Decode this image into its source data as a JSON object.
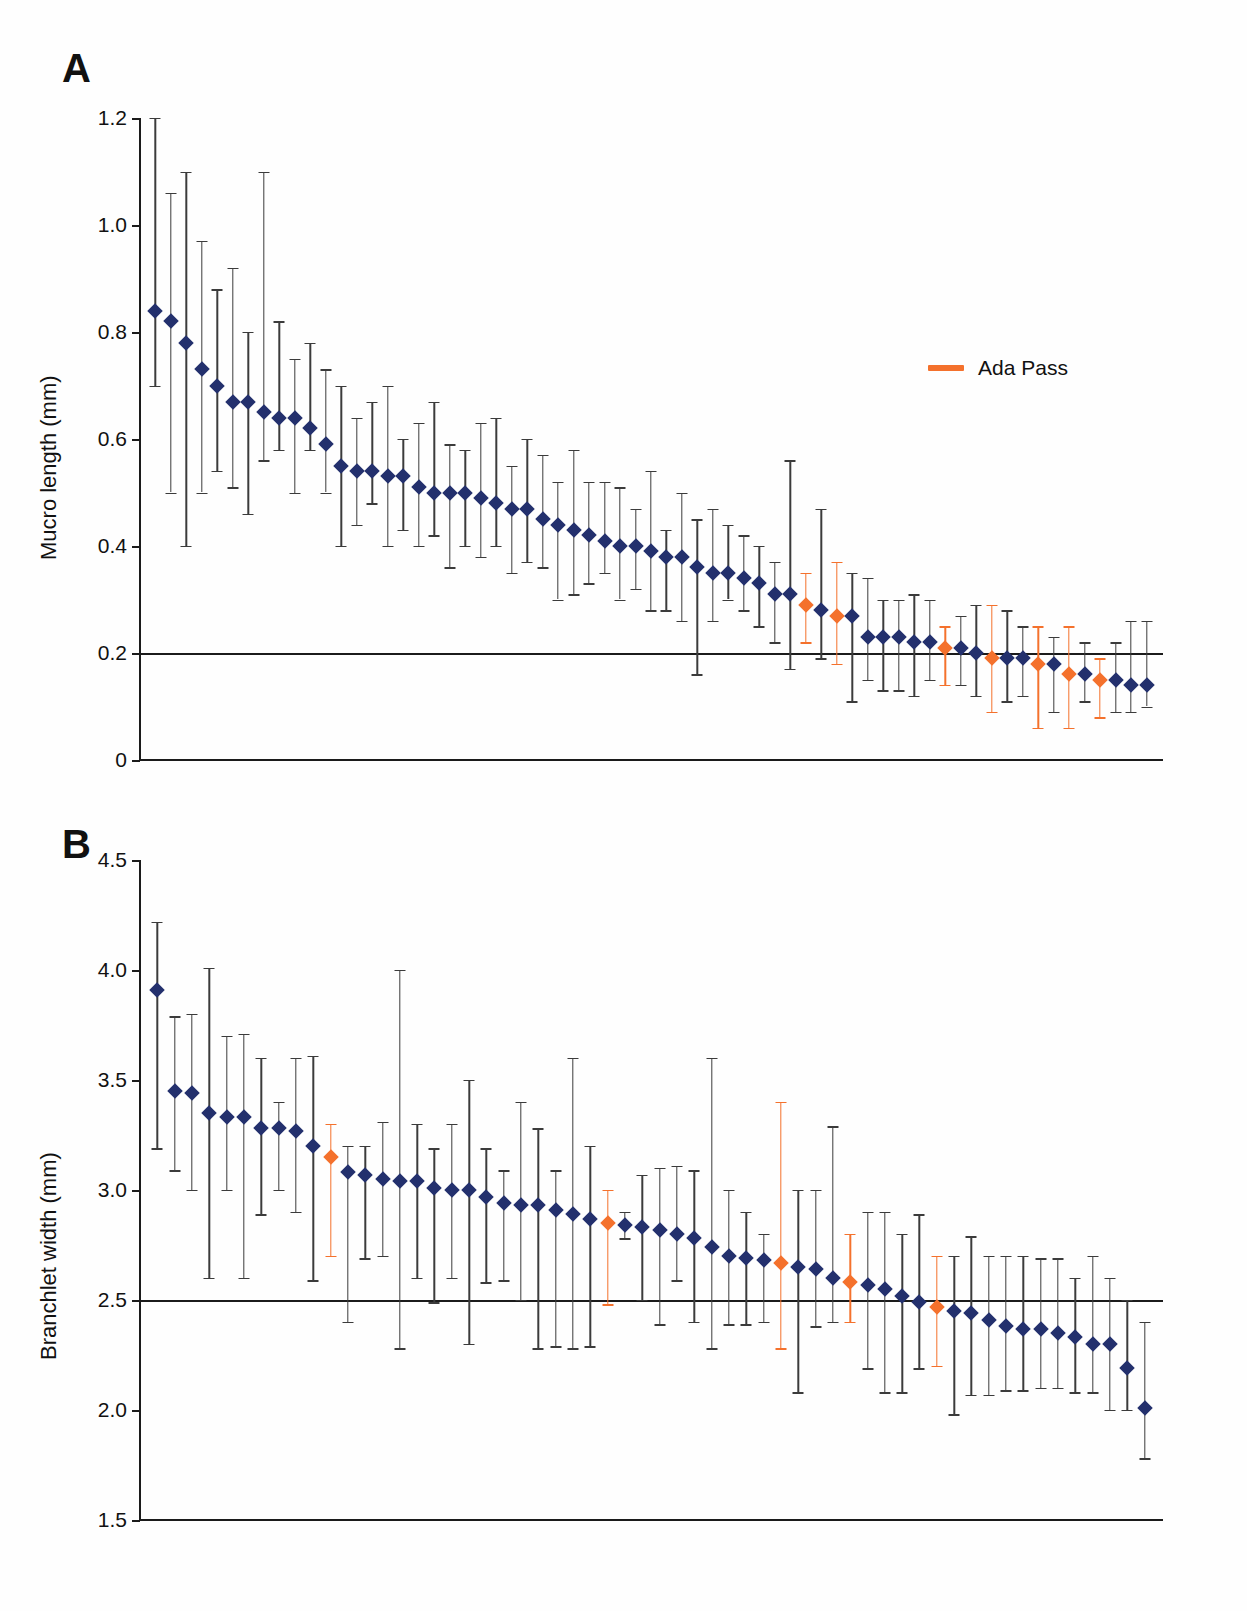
{
  "figure": {
    "background": "#ffffff",
    "marker_color": "#23306d",
    "highlight_color": "#f4712c",
    "axis_color": "#1b1b1b"
  },
  "panels": [
    {
      "letter": "A",
      "ylabel": "Mucro length (mm)",
      "yticks": [
        "0",
        "0.2",
        "0.4",
        "0.6",
        "0.8",
        "1.0",
        "1.2"
      ],
      "reference_line": "0.2",
      "legend": {
        "label": "Ada Pass",
        "swatch": "orange-line-swatch"
      }
    },
    {
      "letter": "B",
      "ylabel": "Branchlet width (mm)",
      "yticks": [
        "1.5",
        "2.0",
        "2.5",
        "3.0",
        "3.5",
        "4.0",
        "4.5"
      ],
      "reference_line": "2.5"
    }
  ],
  "chart_data": [
    {
      "type": "scatter",
      "panel": "A",
      "title": "",
      "xlabel": "",
      "ylabel": "Mucro length (mm)",
      "ylim": [
        0,
        1.2
      ],
      "yticks": [
        0,
        0.2,
        0.4,
        0.6,
        0.8,
        1.0,
        1.2
      ],
      "grid": false,
      "reference_line_y": 0.2,
      "legend": [
        "Ada Pass"
      ],
      "legend_position": "upper-right",
      "error_bars": "min-max range per population",
      "note": "Populations ranked by decreasing mean mucro length",
      "series": [
        {
          "name": "Mucro length mean (min, max)",
          "mean": [
            0.84,
            0.82,
            0.78,
            0.73,
            0.7,
            0.67,
            0.67,
            0.65,
            0.64,
            0.64,
            0.62,
            0.59,
            0.55,
            0.54,
            0.54,
            0.53,
            0.53,
            0.51,
            0.5,
            0.5,
            0.5,
            0.49,
            0.48,
            0.47,
            0.47,
            0.45,
            0.44,
            0.43,
            0.42,
            0.41,
            0.4,
            0.4,
            0.39,
            0.38,
            0.38,
            0.36,
            0.35,
            0.35,
            0.34,
            0.33,
            0.31,
            0.31,
            0.29,
            0.28,
            0.27,
            0.27,
            0.23,
            0.23,
            0.23,
            0.22,
            0.22,
            0.21,
            0.21,
            0.2,
            0.19,
            0.19,
            0.19,
            0.18,
            0.18,
            0.16,
            0.16,
            0.15,
            0.15,
            0.14,
            0.14
          ],
          "min": [
            0.7,
            0.5,
            0.4,
            0.5,
            0.54,
            0.51,
            0.46,
            0.56,
            0.58,
            0.5,
            0.58,
            0.5,
            0.4,
            0.44,
            0.48,
            0.4,
            0.43,
            0.4,
            0.42,
            0.36,
            0.4,
            0.38,
            0.4,
            0.35,
            0.37,
            0.36,
            0.3,
            0.31,
            0.33,
            0.35,
            0.3,
            0.32,
            0.28,
            0.28,
            0.26,
            0.16,
            0.26,
            0.3,
            0.28,
            0.25,
            0.22,
            0.17,
            0.22,
            0.19,
            0.18,
            0.11,
            0.15,
            0.13,
            0.13,
            0.12,
            0.15,
            0.14,
            0.14,
            0.12,
            0.09,
            0.11,
            0.12,
            0.06,
            0.09,
            0.06,
            0.11,
            0.08,
            0.09,
            0.09,
            0.1
          ],
          "max": [
            1.2,
            1.06,
            1.1,
            0.97,
            0.88,
            0.92,
            0.8,
            1.1,
            0.82,
            0.75,
            0.78,
            0.73,
            0.7,
            0.64,
            0.67,
            0.7,
            0.6,
            0.63,
            0.67,
            0.59,
            0.58,
            0.63,
            0.64,
            0.55,
            0.6,
            0.57,
            0.52,
            0.58,
            0.52,
            0.52,
            0.51,
            0.47,
            0.54,
            0.43,
            0.5,
            0.45,
            0.47,
            0.44,
            0.42,
            0.4,
            0.37,
            0.56,
            0.35,
            0.47,
            0.37,
            0.35,
            0.34,
            0.3,
            0.3,
            0.31,
            0.3,
            0.25,
            0.27,
            0.29,
            0.29,
            0.28,
            0.25,
            0.25,
            0.23,
            0.25,
            0.22,
            0.19,
            0.22,
            0.26,
            0.26
          ],
          "highlight_indices": [
            42,
            44,
            51,
            54,
            57,
            59,
            61
          ]
        }
      ]
    },
    {
      "type": "scatter",
      "panel": "B",
      "title": "",
      "xlabel": "",
      "ylabel": "Branchlet width (mm)",
      "ylim": [
        1.5,
        4.5
      ],
      "yticks": [
        1.5,
        2.0,
        2.5,
        3.0,
        3.5,
        4.0,
        4.5
      ],
      "grid": false,
      "reference_line_y": 2.5,
      "error_bars": "min-max range per population",
      "note": "Populations ranked by decreasing mean branchlet width",
      "series": [
        {
          "name": "Branchlet width mean (min, max)",
          "mean": [
            3.91,
            3.45,
            3.44,
            3.35,
            3.33,
            3.33,
            3.28,
            3.28,
            3.27,
            3.2,
            3.15,
            3.08,
            3.07,
            3.05,
            3.04,
            3.04,
            3.01,
            3.0,
            3.0,
            2.97,
            2.94,
            2.93,
            2.93,
            2.91,
            2.89,
            2.87,
            2.85,
            2.84,
            2.83,
            2.82,
            2.8,
            2.78,
            2.74,
            2.7,
            2.69,
            2.68,
            2.67,
            2.65,
            2.64,
            2.6,
            2.58,
            2.57,
            2.55,
            2.52,
            2.49,
            2.47,
            2.45,
            2.44,
            2.41,
            2.38,
            2.37,
            2.37,
            2.35,
            2.33,
            2.3,
            2.3,
            2.19,
            2.01
          ],
          "min": [
            3.19,
            3.09,
            3.0,
            2.6,
            3.0,
            2.6,
            2.89,
            3.0,
            2.9,
            2.59,
            2.7,
            2.4,
            2.69,
            2.7,
            2.28,
            2.6,
            2.49,
            2.6,
            2.3,
            2.58,
            2.59,
            2.5,
            2.28,
            2.29,
            2.28,
            2.29,
            2.48,
            2.78,
            2.5,
            2.39,
            2.59,
            2.4,
            2.28,
            2.39,
            2.39,
            2.4,
            2.28,
            2.08,
            2.38,
            2.4,
            2.4,
            2.19,
            2.08,
            2.08,
            2.19,
            2.2,
            1.98,
            2.07,
            2.07,
            2.09,
            2.09,
            2.1,
            2.1,
            2.08,
            2.08,
            2.0,
            2.0,
            1.78
          ],
          "max": [
            4.22,
            3.79,
            3.8,
            4.01,
            3.7,
            3.71,
            3.6,
            3.4,
            3.6,
            3.61,
            3.3,
            3.2,
            3.2,
            3.31,
            4.0,
            3.3,
            3.19,
            3.3,
            3.5,
            3.19,
            3.09,
            3.4,
            3.28,
            3.09,
            3.6,
            3.2,
            3.0,
            2.9,
            3.07,
            3.1,
            3.11,
            3.09,
            3.6,
            3.0,
            2.9,
            2.8,
            3.4,
            3.0,
            3.0,
            3.29,
            2.8,
            2.9,
            2.9,
            2.8,
            2.89,
            2.7,
            2.7,
            2.79,
            2.7,
            2.7,
            2.7,
            2.69,
            2.69,
            2.6,
            2.7,
            2.6,
            2.5,
            2.4
          ],
          "highlight_indices": [
            10,
            26,
            36,
            40,
            45
          ]
        }
      ]
    }
  ]
}
